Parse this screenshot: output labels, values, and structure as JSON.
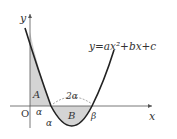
{
  "diagram": {
    "equation": "y=ax²+bx+c",
    "axis_x_label": "x",
    "axis_y_label": "y",
    "origin_label": "O",
    "region_A_label": "A",
    "region_B_label": "B",
    "root_alpha_label": "α",
    "root_beta_label": "β",
    "segment_O_alpha_label": "α",
    "segment_alpha_beta_label": "2α",
    "colors": {
      "curve": "#222222",
      "axis": "#555555",
      "shade": "#d4d4d4",
      "dash": "#777777"
    }
  }
}
